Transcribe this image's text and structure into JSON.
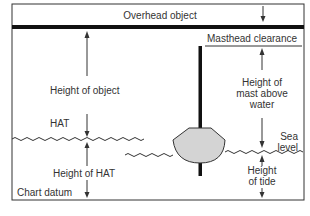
{
  "diagram": {
    "labels": {
      "overhead_object": "Overhead object",
      "masthead_clearance": "Masthead clearance",
      "height_of_object": "Height of object",
      "height_of_mast_line1": "Height of",
      "height_of_mast_line2": "mast above",
      "height_of_mast_line3": "water",
      "hat": "HAT",
      "sea_level_line1": "Sea",
      "sea_level_line2": "level",
      "height_of_hat": "Height of HAT",
      "height_of_tide_line1": "Height",
      "height_of_tide_line2": "of tide",
      "chart_datum": "Chart datum"
    },
    "colors": {
      "border": "#333333",
      "line": "#111111",
      "hull_fill": "#d4d4d4",
      "text": "#333333"
    }
  }
}
